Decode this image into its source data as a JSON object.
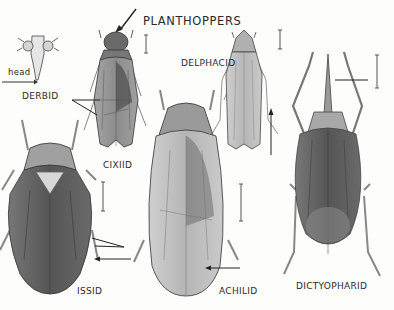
{
  "figure": {
    "title": "PLANTHOPPERS",
    "labels": {
      "head": "head",
      "derbid": "DERBID",
      "cixiid": "CIXIID",
      "delphacid": "DELPHACID",
      "issid": "ISSID",
      "achilid": "ACHILID",
      "dictyopharid": "DICTYOPHARID"
    },
    "colors": {
      "ink": "#2a2a2a",
      "shade_dark": "#555555",
      "shade_mid": "#8a8a8a",
      "shade_light": "#c4c4c4",
      "paper": "#fdfdfc"
    }
  }
}
